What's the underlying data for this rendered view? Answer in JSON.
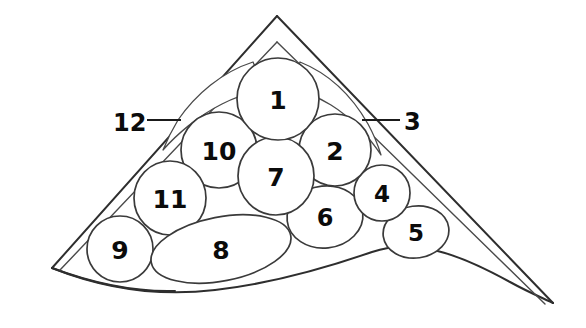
{
  "figure": {
    "type": "line-drawing-diagram",
    "canvas": {
      "width": 586,
      "height": 328
    },
    "background_color": "#ffffff",
    "line_color": "#333333",
    "label_color": "#0b0b0b"
  },
  "cells": [
    {
      "id": "cell-1",
      "label": "1",
      "cx": 278,
      "cy": 99,
      "rx": 41,
      "ry": 41,
      "rot": 0,
      "font_size": 25
    },
    {
      "id": "cell-2",
      "label": "2",
      "cx": 335,
      "cy": 150,
      "rx": 36,
      "ry": 36,
      "rot": 0,
      "font_size": 25
    },
    {
      "id": "cell-4",
      "label": "4",
      "cx": 382,
      "cy": 193,
      "rx": 28,
      "ry": 28,
      "rot": 0,
      "font_size": 23
    },
    {
      "id": "cell-5",
      "label": "5",
      "cx": 416,
      "cy": 232,
      "rx": 33,
      "ry": 26,
      "rot": -8,
      "font_size": 23
    },
    {
      "id": "cell-6",
      "label": "6",
      "cx": 325,
      "cy": 217,
      "rx": 38,
      "ry": 31,
      "rot": -6,
      "font_size": 24
    },
    {
      "id": "cell-7",
      "label": "7",
      "cx": 276,
      "cy": 176,
      "rx": 38,
      "ry": 39,
      "rot": 0,
      "font_size": 25
    },
    {
      "id": "cell-8",
      "label": "8",
      "cx": 221,
      "cy": 249,
      "rx": 71,
      "ry": 32,
      "rot": -11,
      "font_size": 25
    },
    {
      "id": "cell-9",
      "label": "9",
      "cx": 120,
      "cy": 249,
      "rx": 33,
      "ry": 33,
      "rot": 0,
      "font_size": 25
    },
    {
      "id": "cell-10",
      "label": "10",
      "cx": 170,
      "cy": 198,
      "rx": 36,
      "ry": 37,
      "rot": 0,
      "font_size": 25
    },
    {
      "id": "cell-11",
      "label": "11",
      "cx": 219,
      "cy": 150,
      "rx": 38,
      "ry": 38,
      "rot": 0,
      "font_size": 25
    }
  ],
  "callouts": [
    {
      "id": "callout-12",
      "label": "12",
      "text_x": 113,
      "text_y": 123,
      "leader_x1": 147,
      "leader_y1": 120,
      "leader_x2": 181,
      "leader_y2": 120,
      "font_size": 24
    },
    {
      "id": "callout-3",
      "label": "3",
      "text_x": 404,
      "text_y": 122,
      "leader_x1": 400,
      "leader_y1": 120,
      "leader_x2": 362,
      "leader_y2": 120,
      "font_size": 24
    }
  ],
  "geometry": {
    "apex_outer": {
      "x": 277,
      "y": 16
    },
    "apex_inner": {
      "x": 277,
      "y": 42
    },
    "corner_bottom_left": {
      "x": 52,
      "y": 268
    },
    "tip_bottom_right": {
      "x": 553,
      "y": 303
    },
    "outer_outline_path": "M 277 16 L 52 268 L 55 271 C 160 300 300 292 420 266 C 480 252 520 285 553 303 L 277 16",
    "note": "Outer wedge formed by two straight edges meeting at the apex plus a curved lower boundary."
  }
}
